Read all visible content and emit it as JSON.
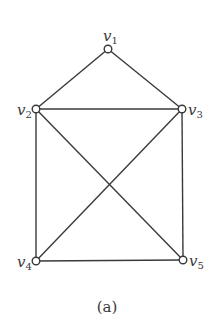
{
  "caption": "(a)",
  "nodes": [
    {
      "id": "v1",
      "base": "v",
      "sub": "1",
      "x": 108,
      "y": 49,
      "lx": 103,
      "ly": 41
    },
    {
      "id": "v2",
      "base": "v",
      "sub": "2",
      "x": 36,
      "y": 109,
      "lx": 17,
      "ly": 115
    },
    {
      "id": "v3",
      "base": "v",
      "sub": "3",
      "x": 182,
      "y": 109,
      "lx": 188,
      "ly": 115
    },
    {
      "id": "v4",
      "base": "v",
      "sub": "4",
      "x": 36,
      "y": 261,
      "lx": 17,
      "ly": 267
    },
    {
      "id": "v5",
      "base": "v",
      "sub": "5",
      "x": 183,
      "y": 260,
      "lx": 189,
      "ly": 266
    }
  ],
  "edges": [
    [
      "v1",
      "v2"
    ],
    [
      "v1",
      "v3"
    ],
    [
      "v2",
      "v3"
    ],
    [
      "v2",
      "v4"
    ],
    [
      "v2",
      "v5"
    ],
    [
      "v3",
      "v4"
    ],
    [
      "v3",
      "v5"
    ],
    [
      "v4",
      "v5"
    ]
  ],
  "colors": {
    "stroke": "#3a3a3a",
    "background": "#ffffff"
  }
}
